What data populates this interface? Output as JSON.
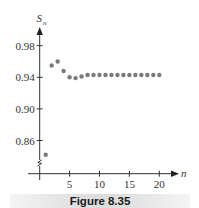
{
  "figure": {
    "caption": "Figure 8.35"
  },
  "colors": {
    "axis": "#333333",
    "points": "#7a7a7a",
    "caption_bg": "#e0e0e0"
  },
  "chart_data": {
    "type": "scatter",
    "title": "",
    "xlabel": "n",
    "ylabel": "S_n",
    "ylabel_main": "S",
    "ylabel_sub": "n",
    "x": [
      1,
      2,
      3,
      4,
      5,
      6,
      7,
      8,
      9,
      10,
      11,
      12,
      13,
      14,
      15,
      16,
      17,
      18,
      19,
      20
    ],
    "series": [
      {
        "name": "S_n",
        "values": [
          0.842,
          0.955,
          0.96,
          0.948,
          0.94,
          0.939,
          0.941,
          0.943,
          0.943,
          0.943,
          0.943,
          0.943,
          0.943,
          0.943,
          0.943,
          0.943,
          0.943,
          0.943,
          0.943,
          0.943
        ]
      }
    ],
    "xticks": [
      5,
      10,
      15,
      20
    ],
    "xtick_labels": [
      "5",
      "10",
      "15",
      "20"
    ],
    "yticks": [
      0.86,
      0.9,
      0.94,
      0.98
    ],
    "ytick_labels": [
      "0.86",
      "0.90",
      "0.94",
      "0.98"
    ],
    "xlim": [
      0,
      23
    ],
    "ylim": [
      0.83,
      1.0
    ],
    "y_axis_break": true,
    "grid": false,
    "legend": "none"
  }
}
